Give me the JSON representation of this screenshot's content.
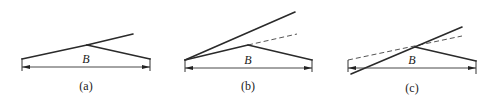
{
  "figure": {
    "panels": [
      {
        "id": "a",
        "caption": "(a)",
        "dimension_label": "B",
        "lines": {
          "left_rise": {
            "x1": 22,
            "y1": 59,
            "x2": 87,
            "y2": 45
          },
          "upper_extension": {
            "x1": 87,
            "y1": 45,
            "x2": 133,
            "y2": 34
          },
          "right_fall": {
            "x1": 87,
            "y1": 45,
            "x2": 150,
            "y2": 59
          }
        },
        "dimension": {
          "x1": 22,
          "x2": 150,
          "y": 67
        },
        "label_pos": {
          "x": 86,
          "y": 63
        },
        "caption_pos": {
          "x": 86,
          "y": 90
        }
      },
      {
        "id": "b",
        "caption": "(b)",
        "dimension_label": "B",
        "lines": {
          "steep_upper": {
            "x1": 185,
            "y1": 60,
            "x2": 295,
            "y2": 12
          },
          "left_rise": {
            "x1": 185,
            "y1": 60,
            "x2": 248,
            "y2": 45
          },
          "dashed_extension": {
            "x1": 248,
            "y1": 45,
            "x2": 297,
            "y2": 34
          },
          "right_fall": {
            "x1": 248,
            "y1": 45,
            "x2": 312,
            "y2": 60
          }
        },
        "dimension": {
          "x1": 185,
          "x2": 312,
          "y": 68
        },
        "label_pos": {
          "x": 248,
          "y": 64
        },
        "caption_pos": {
          "x": 248,
          "y": 90
        }
      },
      {
        "id": "c",
        "caption": "(c)",
        "dimension_label": "B",
        "lines": {
          "crossing_solid": {
            "x1": 351,
            "y1": 74,
            "x2": 462,
            "y2": 27
          },
          "dashed_reference": {
            "x1": 348,
            "y1": 60,
            "x2": 462,
            "y2": 36
          },
          "right_fall": {
            "x1": 415,
            "y1": 47,
            "x2": 476,
            "y2": 61
          }
        },
        "dimension": {
          "x1": 348,
          "x2": 476,
          "y": 68
        },
        "label_pos": {
          "x": 412,
          "y": 64
        },
        "caption_pos": {
          "x": 412,
          "y": 92
        }
      }
    ]
  }
}
